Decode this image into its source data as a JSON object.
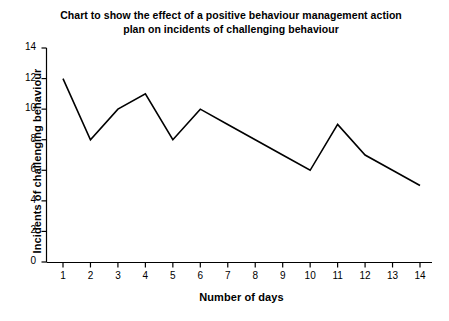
{
  "chart_data": {
    "type": "line",
    "title": "Chart to show the effect of a positive behaviour management action plan on incidents of challenging behaviour",
    "title_line_1": "Chart to show the effect of a positive behaviour management action",
    "title_line_2": "plan on incidents of challenging behaviour",
    "xlabel": "Number of days",
    "ylabel": "Incidents of challenging behaviour",
    "x": [
      1,
      2,
      3,
      4,
      5,
      6,
      7,
      8,
      9,
      10,
      11,
      12,
      13,
      14
    ],
    "values": [
      12,
      8,
      10,
      11,
      8,
      10,
      9,
      8,
      7,
      6,
      9,
      7,
      6,
      5
    ],
    "categories": [
      "1",
      "2",
      "3",
      "4",
      "5",
      "6",
      "7",
      "8",
      "9",
      "10",
      "11",
      "12",
      "13",
      "14"
    ],
    "xtick_labels": [
      "1",
      "2",
      "3",
      "4",
      "5",
      "6",
      "7",
      "8",
      "9",
      "10",
      "11",
      "12",
      "13",
      "14"
    ],
    "ytick_labels": [
      "0",
      "2",
      "4",
      "6",
      "8",
      "10",
      "12",
      "14"
    ],
    "ytick_values": [
      0,
      2,
      4,
      6,
      8,
      10,
      12,
      14
    ],
    "xlim": [
      1,
      14
    ],
    "ylim": [
      0,
      14
    ],
    "grid": false,
    "legend": false,
    "legend_position": "none",
    "line_color": "#000000",
    "background_color": "#ffffff",
    "axis_color": "#000000",
    "markers": false
  }
}
